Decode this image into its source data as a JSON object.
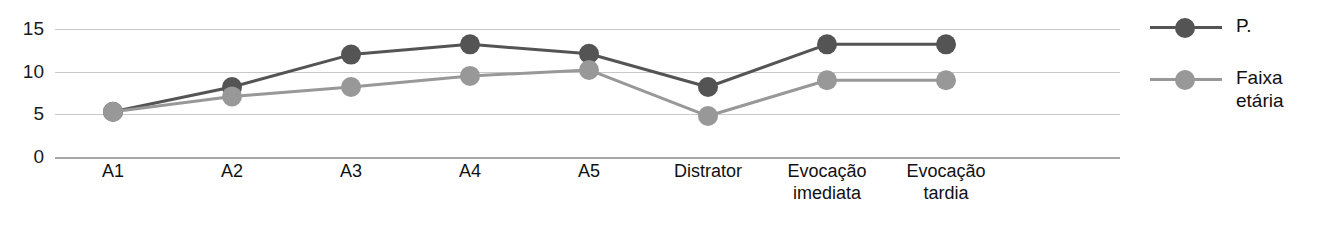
{
  "chart_data": {
    "type": "line",
    "title": "",
    "xlabel": "",
    "ylabel": "",
    "categories": [
      "A1",
      "A2",
      "A3",
      "A4",
      "A5",
      "Distrator",
      "Evocação\nimediata",
      "Evocação\ntardia"
    ],
    "yticks": [
      15,
      10,
      5,
      0
    ],
    "ylim": [
      0,
      17
    ],
    "grid": true,
    "legend_position": "right",
    "series": [
      {
        "name": "P.",
        "color": "#545454",
        "marker": "circle",
        "values": [
          5.3,
          8.2,
          12.0,
          13.2,
          12.1,
          8.2,
          13.2,
          13.2
        ]
      },
      {
        "name": "Faixa\netária",
        "color": "#989898",
        "marker": "circle",
        "values": [
          5.3,
          7.1,
          8.2,
          9.5,
          10.2,
          4.8,
          9.0,
          9.0
        ]
      }
    ]
  },
  "axis": {
    "y_tick_labels": [
      "15",
      "10",
      "5",
      "0"
    ]
  },
  "legend": {
    "entries": [
      {
        "label": "P.",
        "color": "#545454"
      },
      {
        "label": "Faixa\netária",
        "color": "#989898"
      }
    ]
  },
  "colors": {
    "series_dark": "#545454",
    "series_light": "#989898",
    "gridline": "#c8c8c8",
    "axis": "#a8a8a8",
    "background": "#ffffff",
    "text": "#111111"
  }
}
